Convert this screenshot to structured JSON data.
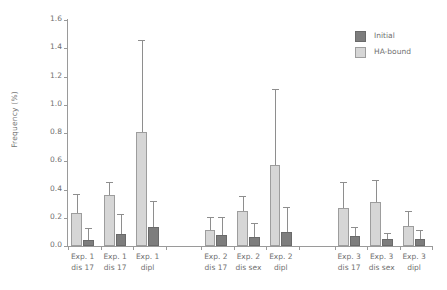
{
  "chart_data": {
    "type": "bar",
    "title": "",
    "xlabel": "",
    "ylabel": "Frequency (%)",
    "ylim": [
      0.0,
      1.6
    ],
    "ytick_step": 0.2,
    "ytick_labels": [
      "0.0",
      "0.2",
      "0.4",
      "0.6",
      "0.8",
      "1.0",
      "1.2",
      "1.4",
      "1.6"
    ],
    "grid": false,
    "legend_position": "top-right",
    "error_bars": "upper-only",
    "group_gap": true,
    "categories": [
      {
        "line1": "Exp. 1",
        "line2": "dis 17"
      },
      {
        "line1": "Exp. 1",
        "line2": "dis 17"
      },
      {
        "line1": "Exp. 1",
        "line2": "dipl"
      },
      {
        "line1": "Exp. 2",
        "line2": "dis 17"
      },
      {
        "line1": "Exp. 2",
        "line2": "dis sex"
      },
      {
        "line1": "Exp. 2",
        "line2": "dipl"
      },
      {
        "line1": "Exp. 3",
        "line2": "dis 17"
      },
      {
        "line1": "Exp. 3",
        "line2": "dis sex"
      },
      {
        "line1": "Exp. 3",
        "line2": "dipl"
      }
    ],
    "series": [
      {
        "name": "HA-bound",
        "color": "#d6d6d6",
        "values": [
          0.235,
          0.36,
          0.81,
          0.115,
          0.245,
          0.575,
          0.27,
          0.31,
          0.145
        ],
        "error_upper": [
          0.37,
          0.455,
          1.455,
          0.205,
          0.355,
          1.11,
          0.455,
          0.47,
          0.245
        ]
      },
      {
        "name": "Initial",
        "color": "#7d7d7d",
        "values": [
          0.045,
          0.085,
          0.135,
          0.075,
          0.065,
          0.1,
          0.07,
          0.05,
          0.05
        ],
        "error_upper": [
          0.13,
          0.225,
          0.32,
          0.205,
          0.16,
          0.275,
          0.135,
          0.095,
          0.115
        ]
      }
    ]
  },
  "legend": {
    "items": [
      {
        "label": "Initial",
        "swatch": "initial"
      },
      {
        "label": "HA-bound",
        "swatch": "habound"
      }
    ]
  }
}
